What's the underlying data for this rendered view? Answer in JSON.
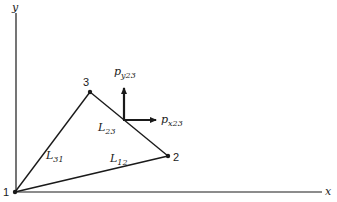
{
  "axes": {
    "x_label": "x",
    "y_label": "y"
  },
  "nodes": [
    {
      "id": "1",
      "label": "1"
    },
    {
      "id": "2",
      "label": "2"
    },
    {
      "id": "3",
      "label": "3"
    }
  ],
  "edges": [
    {
      "from": "1",
      "to": "2",
      "label_main": "L",
      "label_sub": "12"
    },
    {
      "from": "2",
      "to": "3",
      "label_main": "L",
      "label_sub": "23"
    },
    {
      "from": "3",
      "to": "1",
      "label_main": "L",
      "label_sub": "31"
    }
  ],
  "forces": {
    "py": {
      "main": "p",
      "sub": "y23"
    },
    "px": {
      "main": "p",
      "sub": "x23"
    }
  },
  "colors": {
    "line": "#1a1a1a",
    "background": "#ffffff"
  }
}
